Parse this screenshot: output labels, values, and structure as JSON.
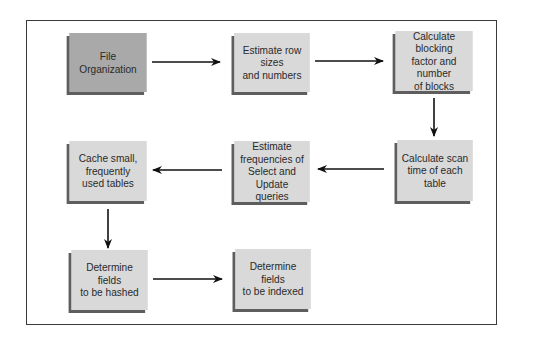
{
  "diagram": {
    "type": "flowchart",
    "nodes": [
      {
        "id": "file_org",
        "label": "File\nOrganization"
      },
      {
        "id": "estimate_rows",
        "label": "Estimate row sizes\nand numbers"
      },
      {
        "id": "blocking_factor",
        "label": "Calculate blocking\nfactor and number\nof blocks"
      },
      {
        "id": "scan_time",
        "label": "Calculate scan\ntime of each\ntable"
      },
      {
        "id": "query_freq",
        "label": "Estimate\nfrequencies of\nSelect and Update\nqueries"
      },
      {
        "id": "cache_tables",
        "label": "Cache small,\nfrequently\nused tables"
      },
      {
        "id": "hashed_fields",
        "label": "Determine fields\nto be hashed"
      },
      {
        "id": "indexed_fields",
        "label": "Determine fields\nto be indexed"
      }
    ],
    "edges": [
      {
        "from": "file_org",
        "to": "estimate_rows"
      },
      {
        "from": "estimate_rows",
        "to": "blocking_factor"
      },
      {
        "from": "blocking_factor",
        "to": "scan_time"
      },
      {
        "from": "scan_time",
        "to": "query_freq"
      },
      {
        "from": "query_freq",
        "to": "cache_tables"
      },
      {
        "from": "cache_tables",
        "to": "hashed_fields"
      },
      {
        "from": "hashed_fields",
        "to": "indexed_fields"
      }
    ],
    "colors": {
      "start_node": "#a9a9a9",
      "node": "#d9d9d9",
      "shadow": "#5e5e5e",
      "arrow": "#111111",
      "frame": "#3a3a3a"
    }
  }
}
